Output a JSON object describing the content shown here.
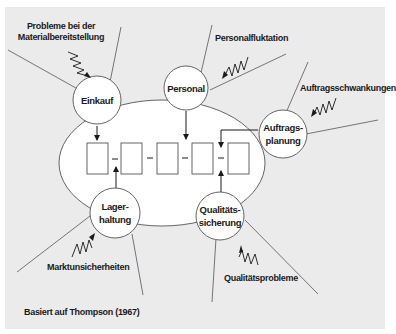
{
  "diagram": {
    "colors": {
      "panel": "#ebebeb",
      "stroke": "#555555",
      "core_fill": "#ffffff",
      "text": "#1a1a1a"
    },
    "core": {
      "shape": "ellipse",
      "process_boxes": 5
    },
    "nodes": [
      {
        "id": "einkauf",
        "line1": "Einkauf",
        "line2": ""
      },
      {
        "id": "personal",
        "line1": "Personal",
        "line2": ""
      },
      {
        "id": "auftragsplanung",
        "line1": "Auftrags-",
        "line2": "planung"
      },
      {
        "id": "lagerhaltung",
        "line1": "Lager-",
        "line2": "haltung"
      },
      {
        "id": "qualitaetssicherung",
        "line1": "Qualitäts-",
        "line2": "sicherung"
      }
    ],
    "disturbances": [
      {
        "target": "einkauf",
        "line1": "Probleme bei der",
        "line2": "Materialbereitstellung"
      },
      {
        "target": "personal",
        "line1": "Personalfluktation"
      },
      {
        "target": "auftragsplanung",
        "line1": "Auftragsschwankungen"
      },
      {
        "target": "lagerhaltung",
        "line1": "Marktunsicherheiten"
      },
      {
        "target": "qualitaetssicherung",
        "line1": "Qualitätsprobleme"
      }
    ],
    "source": "Basiert auf Thompson (1967)"
  }
}
